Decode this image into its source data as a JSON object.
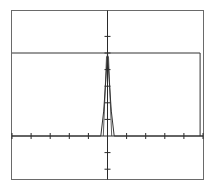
{
  "chart_data": {
    "type": "line",
    "title": "",
    "xlabel": "",
    "ylabel": "",
    "grid": false,
    "legend": null,
    "xlim": [
      -5,
      5
    ],
    "ylim": [
      -2.5,
      5
    ],
    "x_ticks": [
      -5,
      -4,
      -3,
      -2,
      -1,
      0,
      1,
      2,
      3,
      4,
      5
    ],
    "y_ticks": [
      -2,
      -1,
      1,
      2,
      3,
      4,
      5,
      6
    ],
    "series": [
      {
        "name": "pulse",
        "x": [
          -5,
          -0.35,
          -0.2,
          -0.1,
          0,
          0.1,
          0.2,
          0.35,
          5
        ],
        "y": [
          0,
          0,
          1.5,
          3.2,
          5,
          3.2,
          1.5,
          0,
          0
        ]
      },
      {
        "name": "level",
        "x": [
          -5,
          4.85,
          4.85
        ],
        "y": [
          5,
          5,
          0
        ]
      }
    ],
    "annotations": []
  },
  "colors": {
    "frame": "#6a6a6a",
    "axis": "#2a2a2a",
    "curve": "#333333"
  },
  "caption": ""
}
